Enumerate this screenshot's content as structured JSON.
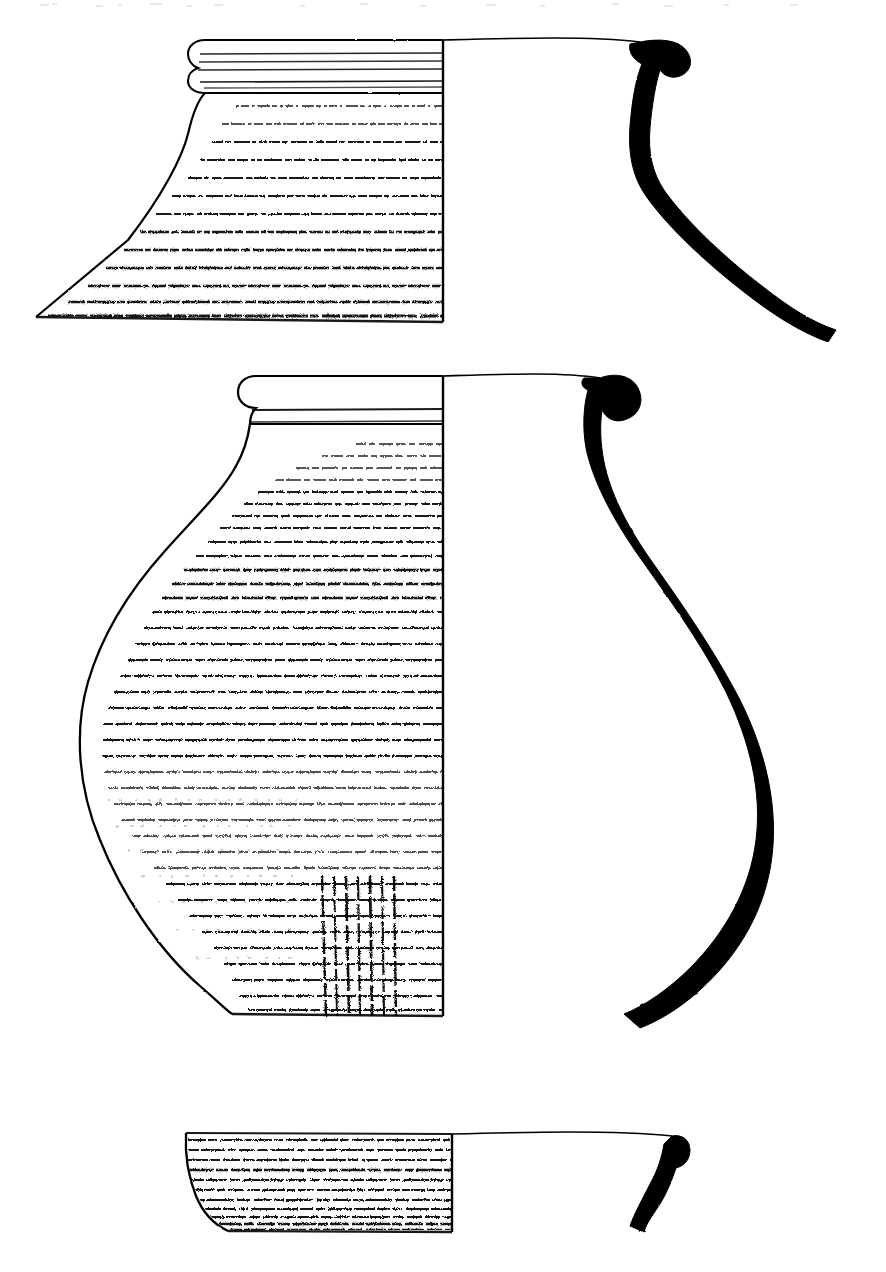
{
  "plate": {
    "title": "Archaeological pottery profile drawing plate",
    "description": "Technical ink illustration of three ceramic vessel fragments, each drawn as a half-section: the left half shows the exterior surface rendered with horizontal dashed burnishing/combing hatching, the right half is left blank interior, and a solid black wall cross-section profile is drawn at the far right.",
    "background_color": "#ffffff",
    "ink_color": "#000000",
    "width": 886,
    "height": 1272,
    "convention": "left half = exterior surface texture, right half = blank interior, far right = filled black wall section",
    "figure_count": 3
  },
  "figures": [
    {
      "id": "figure-1",
      "label": "upper-vessel-neck-and-shoulder",
      "description": "Wide flaring neck and shoulder sherd with multiple-grooved rolled rim; body broken off at lower edge.",
      "rim_type": "thickened rolled rim with three horizontal grooves",
      "centerline_x": 443,
      "rim_top_y": 40,
      "break_bottom_y": 322,
      "max_left_x": 36,
      "hatching_band_count": 14,
      "section": {
        "label": "wall-section-figure-1",
        "fill": "#000000",
        "rim_x": 640,
        "base_x": 836
      }
    },
    {
      "id": "figure-2",
      "label": "middle-vessel-complete-jar",
      "description": "Large globular jar with everted hooked rim, short concave neck, broad rounded body and narrow flat base; exterior heavily burnished with horizontal bands plus a vertical combed panel low on the belly.",
      "rim_type": "everted rolled / hooked rim",
      "centerline_x": 443,
      "rim_top_y": 374,
      "base_bottom_y": 1017,
      "max_left_x": 79,
      "max_width_y": 735,
      "hatching_band_count": 33,
      "vertical_panel": {
        "label": "vertical-comb-panel",
        "x_start": 318,
        "x_end": 400,
        "y_start": 875,
        "y_end": 1015
      },
      "section": {
        "label": "wall-section-figure-2",
        "fill": "#000000",
        "rim_x": 600,
        "belly_max_x": 772,
        "base_y": 1012
      }
    },
    {
      "id": "figure-3",
      "label": "lower-vessel-base-sherd",
      "description": "Shallow lower body / base sherd with straight sloping wall curving to a narrow flat base; exterior with close horizontal burnish bands.",
      "rim_type": "broken upper edge",
      "centerline_x": 452,
      "top_y": 1132,
      "base_bottom_y": 1230,
      "max_left_x": 184,
      "hatching_band_count": 11,
      "section": {
        "label": "wall-section-figure-3",
        "fill": "#000000",
        "top_x": 672,
        "base_x": 644
      }
    }
  ],
  "annotations": {
    "scale_bar": null,
    "catalogue_numbers": [],
    "caption": null,
    "visible_text": []
  }
}
